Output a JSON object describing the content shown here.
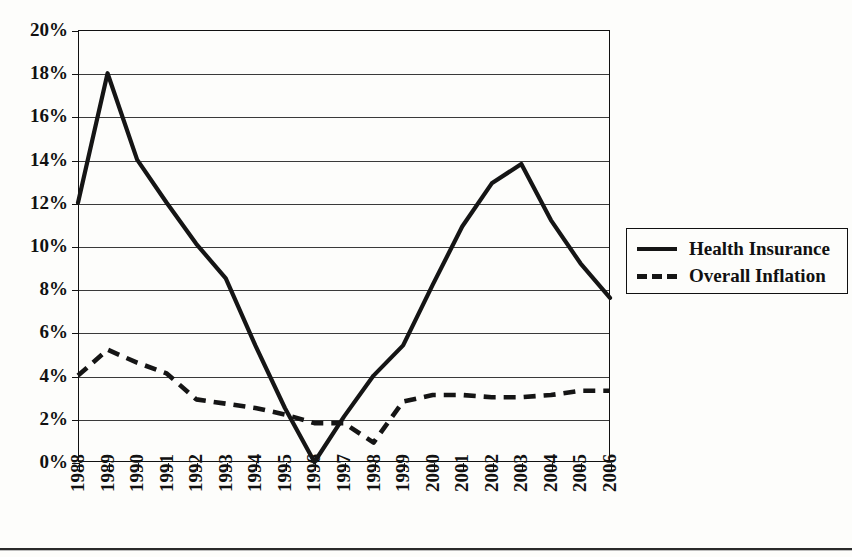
{
  "chart_data": {
    "type": "line",
    "title": "",
    "subtitle": "",
    "xlabel": "",
    "ylabel": "",
    "grid": true,
    "legend_position": "right",
    "ylim": [
      0,
      20
    ],
    "ytick_labels": [
      "20%",
      "18%",
      "16%",
      "14%",
      "12%",
      "10%",
      "8%",
      "6%",
      "4%",
      "2%",
      "0%"
    ],
    "ytick_values": [
      20,
      18,
      16,
      14,
      12,
      10,
      8,
      6,
      4,
      2,
      0
    ],
    "categories": [
      "1988",
      "1989",
      "1990",
      "1991",
      "1992",
      "1993",
      "1994",
      "1995",
      "1996",
      "1997",
      "1998",
      "1999",
      "2000",
      "2001",
      "2002",
      "2003",
      "2004",
      "2005",
      "2006"
    ],
    "series": [
      {
        "name": "Health Insurance",
        "style": "solid",
        "color": "#151515",
        "values": [
          12.0,
          18.0,
          14.0,
          12.0,
          10.1,
          8.5,
          5.4,
          2.5,
          0.0,
          2.1,
          4.0,
          5.4,
          8.2,
          10.9,
          12.9,
          13.8,
          11.2,
          9.2,
          7.6
        ]
      },
      {
        "name": "Overall Inflation",
        "style": "dashed",
        "color": "#151515",
        "values": [
          4.0,
          5.2,
          4.6,
          4.1,
          2.9,
          2.7,
          2.5,
          2.2,
          1.8,
          1.8,
          0.9,
          2.8,
          3.1,
          3.1,
          3.0,
          3.0,
          3.1,
          3.3,
          3.3
        ]
      }
    ]
  },
  "legend": {
    "items": [
      {
        "label": "Health Insurance",
        "style": "solid"
      },
      {
        "label": "Overall Inflation",
        "style": "dashed"
      }
    ]
  }
}
